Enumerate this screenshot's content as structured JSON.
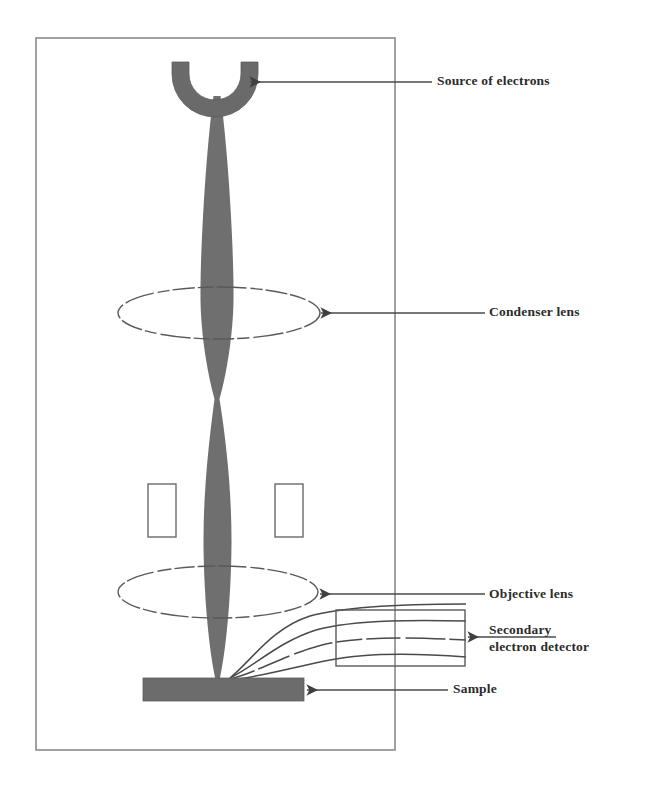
{
  "figure": {
    "background_color": "#ffffff",
    "frame": {
      "name": "column-enclosure",
      "x": 36,
      "y": 38,
      "width": 359,
      "height": 712,
      "stroke_color": "#8a8a8a",
      "stroke_width": 1.6
    }
  },
  "palette": {
    "beam_gray": "#6f6f6f",
    "source_gray": "#6a6a6a",
    "sample_gray": "#6c6c6c",
    "lens_outline": "#5a5a5a",
    "trajectory": "#4a4a4a",
    "leader_line": "#4a4a4a",
    "aperture_outline": "#6a6a6a",
    "detector_outline": "#5a5a5a",
    "text_color": "#2b2b2b"
  },
  "components": {
    "electron_source": {
      "name": "Source of electrons",
      "shape": "cup",
      "center_x": 215,
      "top_y": 62,
      "outer_radius": 43,
      "inner_radius": 26
    },
    "condenser_lens": {
      "name": "Condenser lens",
      "shape": "ellipse",
      "cx": 219,
      "cy": 313,
      "rx": 101,
      "ry": 26
    },
    "objective_lens": {
      "name": "Objective lens",
      "shape": "ellipse",
      "cx": 218,
      "cy": 592,
      "rx": 100,
      "ry": 26
    },
    "aperture_left": {
      "name": "scan-coil-left",
      "x": 148,
      "y": 484,
      "width": 28,
      "height": 53
    },
    "aperture_right": {
      "name": "scan-coil-right",
      "x": 275,
      "y": 484,
      "width": 28,
      "height": 53
    },
    "detector_box": {
      "name": "Secondary electron detector",
      "x": 336,
      "y": 610,
      "width": 129,
      "height": 56
    },
    "sample": {
      "name": "Sample",
      "x": 143,
      "y": 678,
      "width": 161,
      "height": 23
    },
    "beam": {
      "name": "electron-beam",
      "axis_x": 217,
      "source_y": 96,
      "crossover_y": 400,
      "focus_y": 681,
      "max_half_width_upper": 17,
      "max_half_width_lower": 14
    }
  },
  "trajectories": {
    "name": "secondary-electron-paths",
    "count": 4,
    "origin_x": 230,
    "origin_y": 678,
    "end_x": 466
  },
  "labels": [
    {
      "id": "source-of-electrons",
      "text": "Source of electrons",
      "x": 437,
      "y": 73,
      "leader": {
        "from_x": 250,
        "to_x": 432,
        "y": 82,
        "arrow": true,
        "arrow_at": "left"
      }
    },
    {
      "id": "condenser-lens",
      "text": "Condenser lens",
      "x": 489,
      "y": 304,
      "leader": {
        "from_x": 321,
        "to_x": 485,
        "y": 313,
        "arrow": true,
        "arrow_at": "left"
      }
    },
    {
      "id": "objective-lens",
      "text": "Objective lens",
      "x": 489,
      "y": 586,
      "leader": {
        "from_x": 320,
        "to_x": 485,
        "y": 594,
        "arrow": true,
        "arrow_at": "left"
      }
    },
    {
      "id": "secondary-electron-detector",
      "text": "Secondary\nelectron detector",
      "x": 489,
      "y": 622,
      "leader": {
        "from_x": 468,
        "to_x": 556,
        "y": 637,
        "arrow": true,
        "arrow_at": "left"
      }
    },
    {
      "id": "sample",
      "text": "Sample",
      "x": 453,
      "y": 681,
      "leader": {
        "from_x": 307,
        "to_x": 448,
        "y": 690,
        "arrow": true,
        "arrow_at": "left"
      }
    }
  ]
}
